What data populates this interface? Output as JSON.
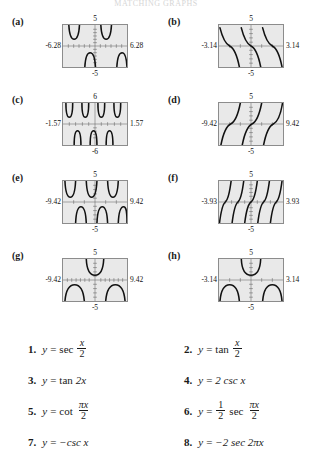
{
  "header": {
    "cut_text": "MATCHING GRAPHS"
  },
  "panels": [
    {
      "label": "(a)",
      "top": "5",
      "bottom": "-5",
      "left": "-6.28",
      "right": "6.28",
      "curve": "sec-half-x"
    },
    {
      "label": "(b)",
      "top": "5",
      "bottom": "-5",
      "left": "-3.14",
      "right": "3.14",
      "curve": "cot-pix-2"
    },
    {
      "label": "(c)",
      "top": "6",
      "bottom": "-6",
      "left": "-1.57",
      "right": "1.57",
      "curve": "neg2-sec-2pix"
    },
    {
      "label": "(d)",
      "top": "5",
      "bottom": "-5",
      "left": "-9.42",
      "right": "9.42",
      "curve": "tan-half-x"
    },
    {
      "label": "(e)",
      "top": "5",
      "bottom": "-5",
      "left": "-9.42",
      "right": "9.42",
      "curve": "2-csc-x"
    },
    {
      "label": "(f)",
      "top": "5",
      "bottom": "-5",
      "left": "-3.93",
      "right": "3.93",
      "curve": "tan-2x"
    },
    {
      "label": "(g)",
      "top": "5",
      "bottom": "-5",
      "left": "-9.42",
      "right": "9.42",
      "curve": "neg-csc-x"
    },
    {
      "label": "(h)",
      "top": "5",
      "bottom": "-5",
      "left": "-3.14",
      "right": "3.14",
      "curve": "half-sec-pix-2"
    }
  ],
  "equations": [
    {
      "num": "1.",
      "lhs": "y",
      "eq": "=",
      "fn": "sec",
      "frac_num": "x",
      "frac_den": "2",
      "plain": ""
    },
    {
      "num": "2.",
      "lhs": "y",
      "eq": "=",
      "fn": "tan",
      "frac_num": "x",
      "frac_den": "2",
      "plain": ""
    },
    {
      "num": "3.",
      "lhs": "y",
      "eq": "=",
      "fn": "tan",
      "frac_num": "",
      "frac_den": "",
      "plain": "2x"
    },
    {
      "num": "4.",
      "lhs": "y",
      "eq": "=",
      "fn": "",
      "frac_num": "",
      "frac_den": "",
      "plain": "2 csc x"
    },
    {
      "num": "5.",
      "lhs": "y",
      "eq": "=",
      "fn": "cot",
      "frac_num": "πx",
      "frac_den": "2",
      "plain": ""
    },
    {
      "num": "6.",
      "lhs": "y",
      "eq": "=",
      "fn": "sec",
      "frac_num": "πx",
      "frac_den": "2",
      "plain": "",
      "coef_num": "1",
      "coef_den": "2"
    },
    {
      "num": "7.",
      "lhs": "y",
      "eq": "=",
      "fn": "",
      "frac_num": "",
      "frac_den": "",
      "plain": "−csc x"
    },
    {
      "num": "8.",
      "lhs": "y",
      "eq": "=",
      "fn": "",
      "frac_num": "",
      "frac_den": "",
      "plain": "−2 sec 2πx"
    }
  ],
  "colors": {
    "plot_fill": "#e9e9e9",
    "plot_border": "#8c8c8c",
    "curve": "#111111",
    "text": "#1a1a1a"
  }
}
